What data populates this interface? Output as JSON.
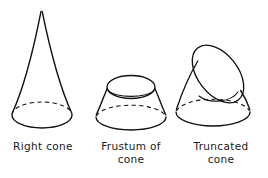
{
  "figure": {
    "background_color": "#ffffff",
    "stroke_color": "#111111",
    "kind": "line-drawing"
  },
  "figures": [
    {
      "id": "right-cone",
      "name": "Right cone",
      "caption": "Right cone",
      "description": "A right circular cone with apex at top and an elliptical base; the rear half of the base circle is drawn as a dashed hidden edge.",
      "apex": {
        "x": 41,
        "y": 11
      },
      "base_ellipse": {
        "cx": 42,
        "cy": 115,
        "rx": 30,
        "ry": 13
      },
      "hidden_back_arc": true
    },
    {
      "id": "frustum-of-cone",
      "name": "Frustum of cone",
      "caption": "Frustum of\ncone",
      "caption_line_1": "Frustum of",
      "caption_line_2": "cone",
      "description": "A cone with the top cut off parallel to the base, showing an open top rim and an elliptical base with a dashed hidden rear arc.",
      "top_ellipse": {
        "cx": 131,
        "cy": 87,
        "rx": 24,
        "ry": 11
      },
      "base_ellipse": {
        "cx": 131,
        "cy": 117,
        "rx": 35,
        "ry": 13
      },
      "inner_rim_visible": true,
      "hidden_back_arc": true
    },
    {
      "id": "truncated-cone",
      "name": "Truncated cone",
      "caption": "Truncated\ncone",
      "caption_line_1": "Truncated",
      "caption_line_2": "cone",
      "description": "A cone sliced by an oblique plane, producing a large tilted elliptical opening; interior far wall and dashed hidden base arc are shown.",
      "cut_ellipse": {
        "cx": 218,
        "cy": 74,
        "rx": 33,
        "ry": 20,
        "rotation_deg": 52
      },
      "base_ellipse": {
        "cx": 213,
        "cy": 112,
        "rx": 37,
        "ry": 14
      },
      "inner_wall_visible": true,
      "hidden_back_arc": true
    }
  ],
  "captions": {
    "right_cone": "Right cone",
    "frustum_of_cone": "Frustum of\ncone",
    "truncated_cone": "Truncated\ncone"
  }
}
